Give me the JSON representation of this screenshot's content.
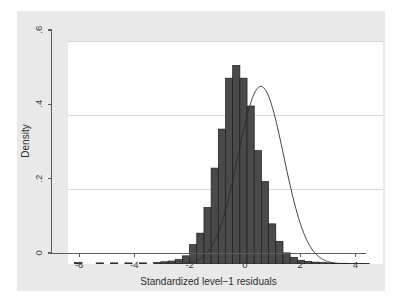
{
  "chart_data": {
    "type": "bar",
    "title": "",
    "subtitle": "",
    "xlabel": "Standardized level−1 residuals",
    "ylabel": "Density",
    "xlim": [
      -7.0,
      4.4
    ],
    "ylim": [
      0,
      0.6
    ],
    "xticks": [
      -6,
      -4,
      -2,
      0,
      2,
      4
    ],
    "xticklabels": [
      "-6",
      "-4",
      "-2",
      "0",
      "2",
      "4"
    ],
    "yticks": [
      0,
      0.2,
      0.4,
      0.6
    ],
    "yticklabels": [
      "0",
      ".2",
      ".4",
      ".6"
    ],
    "grid": "horizontal",
    "legend": "none",
    "bar_color": "#4a4a4a",
    "bar_edge_color": "#1c1c1c",
    "curve_color": "#2b2b2b",
    "plot_bgcolor": "#ffffff",
    "figure_bgcolor": "#e9e9e9",
    "bin_width": 0.26,
    "categories": [
      -6.63,
      -6.37,
      -6.11,
      -5.85,
      -5.59,
      -5.33,
      -5.07,
      -4.81,
      -4.55,
      -4.29,
      -4.03,
      -3.77,
      -3.51,
      -3.25,
      -2.99,
      -2.73,
      -2.47,
      -2.21,
      -1.95,
      -1.69,
      -1.43,
      -1.17,
      -0.91,
      -0.65,
      -0.39,
      -0.13,
      0.13,
      0.39,
      0.65,
      0.91,
      1.17,
      1.43,
      1.69,
      1.95,
      2.21,
      2.47,
      2.73,
      2.99,
      3.25,
      3.51,
      3.77
    ],
    "values": [
      0.004,
      0.0,
      0.0,
      0.003,
      0.0,
      0.003,
      0.0,
      0.003,
      0.0,
      0.003,
      0.0,
      0.004,
      0.006,
      0.008,
      0.012,
      0.022,
      0.052,
      0.083,
      0.152,
      0.258,
      0.363,
      0.5,
      0.534,
      0.5,
      0.425,
      0.305,
      0.222,
      0.108,
      0.061,
      0.03,
      0.018,
      0.01,
      0.007,
      0.005,
      0.004,
      0.003,
      0.002,
      0.002,
      0.001,
      0.001,
      0.001
    ],
    "overlay_curve": {
      "name": "normal density",
      "type": "line",
      "mean": -0.02,
      "sd": 0.83,
      "peak": 0.478
    }
  },
  "axes": {
    "y_title": "Density",
    "x_title": "Standardized level−1 residuals"
  }
}
